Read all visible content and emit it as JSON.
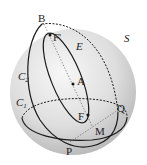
{
  "diagram": {
    "type": "geometry-sphere",
    "sphere_label": "S",
    "points": {
      "B": "B",
      "F_prime": "F'",
      "A": "A",
      "F": "F",
      "Q": "Q",
      "M": "M",
      "P": "P"
    },
    "curves": {
      "ellipse": "E",
      "circle1": "C",
      "circle1_sub": "1",
      "circle2": "C",
      "circle2_sub": "2"
    },
    "colors": {
      "sphere_light": "#f4f4f4",
      "sphere_dark": "#bdbdbd",
      "stroke": "#1a1a1a"
    }
  }
}
